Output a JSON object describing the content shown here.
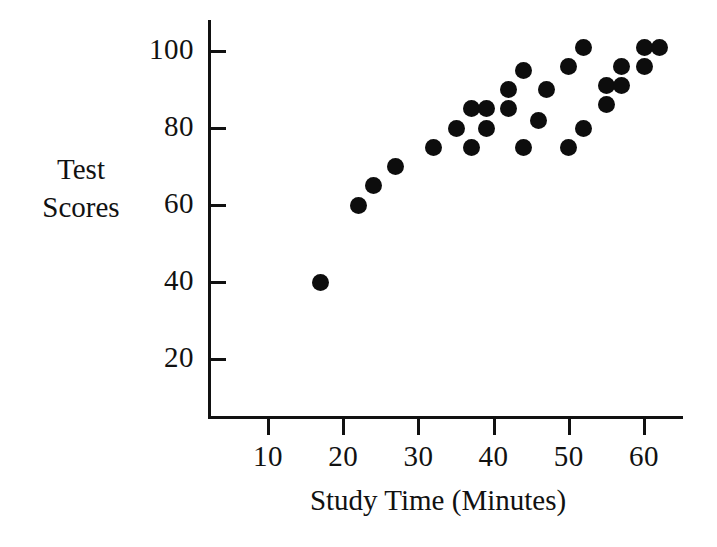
{
  "chart_data": {
    "type": "scatter",
    "title": "",
    "xlabel": "Study Time (Minutes)",
    "ylabel": "Test Scores",
    "ylabel_lines": [
      "Test",
      "Scores"
    ],
    "xlim": [
      0,
      64
    ],
    "ylim": [
      0,
      106
    ],
    "xticks": [
      10,
      20,
      30,
      40,
      50,
      60
    ],
    "yticks": [
      20,
      40,
      60,
      80,
      100
    ],
    "xtick_labels": [
      "10",
      "20",
      "30",
      "40",
      "50",
      "60"
    ],
    "ytick_labels": [
      "20",
      "40",
      "60",
      "80",
      "100"
    ],
    "grid": false,
    "legend": false,
    "marker": "filled-circle",
    "marker_color": "#0d0d0d",
    "axis_color": "#111111",
    "background_color": "#ffffff",
    "points": [
      {
        "x": 17,
        "y": 40
      },
      {
        "x": 22,
        "y": 60
      },
      {
        "x": 24,
        "y": 65
      },
      {
        "x": 27,
        "y": 70
      },
      {
        "x": 32,
        "y": 75
      },
      {
        "x": 35,
        "y": 80
      },
      {
        "x": 37,
        "y": 85
      },
      {
        "x": 37,
        "y": 75
      },
      {
        "x": 39,
        "y": 85
      },
      {
        "x": 39,
        "y": 80
      },
      {
        "x": 42,
        "y": 90
      },
      {
        "x": 42,
        "y": 85
      },
      {
        "x": 44,
        "y": 95
      },
      {
        "x": 44,
        "y": 75
      },
      {
        "x": 46,
        "y": 82
      },
      {
        "x": 47,
        "y": 90
      },
      {
        "x": 50,
        "y": 96
      },
      {
        "x": 50,
        "y": 75
      },
      {
        "x": 52,
        "y": 101
      },
      {
        "x": 52,
        "y": 80
      },
      {
        "x": 55,
        "y": 91
      },
      {
        "x": 55,
        "y": 86
      },
      {
        "x": 57,
        "y": 96
      },
      {
        "x": 57,
        "y": 91
      },
      {
        "x": 60,
        "y": 101
      },
      {
        "x": 60,
        "y": 96
      },
      {
        "x": 62,
        "y": 101
      }
    ]
  },
  "axes": {
    "y_title_line1": "Test",
    "y_title_line2": "Scores",
    "x_title": "Study Time (Minutes)"
  }
}
